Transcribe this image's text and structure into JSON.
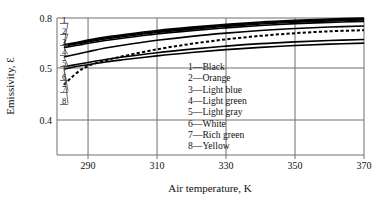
{
  "chart_data": {
    "type": "line",
    "title": "",
    "xlabel": "Air temperature, K",
    "ylabel": "Emissivity, Ɛ",
    "xlim": [
      281,
      370
    ],
    "ylim": [
      0.355,
      0.8
    ],
    "xticks": [
      290,
      310,
      330,
      350,
      370
    ],
    "xticklabels": [
      "290",
      "310",
      "330",
      "350",
      "370"
    ],
    "yticks": [
      0.4,
      0.5,
      0.8
    ],
    "yticklabels": [
      "0.4",
      "0.5",
      "0.8"
    ],
    "grid": true,
    "y_axis_note": "broken / nonlinear axis: 0.4 to 0.5 spans a larger pixel range than 0.5 to 0.8",
    "legend_position": "inside-center-right",
    "legend_entries": [
      {
        "key": "1",
        "label": "1—Black"
      },
      {
        "key": "2",
        "label": "2—Orange"
      },
      {
        "key": "3",
        "label": "3—Light blue"
      },
      {
        "key": "4",
        "label": "4—Light green"
      },
      {
        "key": "5",
        "label": "5—Light gray"
      },
      {
        "key": "6",
        "label": "6—White"
      },
      {
        "key": "7",
        "label": "7—Rich green"
      },
      {
        "key": "8",
        "label": "8—Yellow"
      }
    ],
    "curve_callouts": [
      "1",
      "2",
      "3",
      "4",
      "5",
      "6",
      "7",
      "8"
    ],
    "x": [
      283,
      287,
      290,
      295,
      300,
      310,
      320,
      330,
      340,
      350,
      360,
      370
    ],
    "series": [
      {
        "name": "1",
        "label": "Black",
        "style": "solid",
        "values": [
          0.64,
          0.655,
          0.668,
          0.686,
          0.7,
          0.725,
          0.745,
          0.762,
          0.776,
          0.786,
          0.794,
          0.8
        ]
      },
      {
        "name": "2",
        "label": "Orange",
        "style": "solid",
        "values": [
          0.636,
          0.65,
          0.662,
          0.68,
          0.694,
          0.719,
          0.739,
          0.756,
          0.77,
          0.781,
          0.789,
          0.795
        ]
      },
      {
        "name": "3",
        "label": "Light blue",
        "style": "solid",
        "values": [
          0.632,
          0.645,
          0.657,
          0.674,
          0.688,
          0.713,
          0.733,
          0.75,
          0.764,
          0.775,
          0.783,
          0.789
        ]
      },
      {
        "name": "4",
        "label": "Light green",
        "style": "solid",
        "values": [
          0.622,
          0.636,
          0.648,
          0.665,
          0.679,
          0.704,
          0.724,
          0.741,
          0.755,
          0.766,
          0.774,
          0.78
        ]
      },
      {
        "name": "5",
        "label": "Light gray",
        "style": "solid",
        "values": [
          0.566,
          0.584,
          0.598,
          0.62,
          0.637,
          0.666,
          0.69,
          0.709,
          0.725,
          0.737,
          0.746,
          0.752
        ]
      },
      {
        "name": "6",
        "label": "White",
        "style": "dashed",
        "values": [
          0.468,
          0.492,
          0.512,
          0.545,
          0.57,
          0.612,
          0.645,
          0.672,
          0.693,
          0.709,
          0.72,
          0.727
        ]
      },
      {
        "name": "7",
        "label": "Rich green",
        "style": "solid",
        "values": [
          0.508,
          0.522,
          0.533,
          0.551,
          0.566,
          0.592,
          0.613,
          0.631,
          0.646,
          0.657,
          0.665,
          0.671
        ]
      },
      {
        "name": "8",
        "label": "Yellow",
        "style": "solid",
        "values": [
          0.498,
          0.51,
          0.52,
          0.536,
          0.549,
          0.573,
          0.593,
          0.61,
          0.624,
          0.635,
          0.643,
          0.649
        ]
      }
    ]
  }
}
